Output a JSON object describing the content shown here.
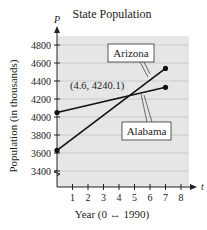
{
  "chart_data": {
    "type": "line",
    "title": "State Population",
    "xlabel": "Year (0 ↔ 1990)",
    "ylabel": "Population (in thousands)",
    "x_axis_var": "t",
    "y_axis_var": "P",
    "xticks": [
      1,
      2,
      3,
      4,
      5,
      6,
      7,
      8
    ],
    "yticks": [
      3400,
      3600,
      3800,
      4000,
      4200,
      4400,
      4600,
      4800
    ],
    "xlim": [
      0,
      8.5
    ],
    "ylim": [
      3300,
      4900
    ],
    "grid": true,
    "series": [
      {
        "name": "Arizona",
        "x": [
          0,
          7
        ],
        "y": [
          3630,
          4540
        ]
      },
      {
        "name": "Alabama",
        "x": [
          0,
          7
        ],
        "y": [
          4050,
          4330
        ]
      }
    ],
    "annotations": [
      {
        "text": "(4.6, 4240.1)",
        "x": 4.6,
        "y": 4240.1
      }
    ]
  }
}
